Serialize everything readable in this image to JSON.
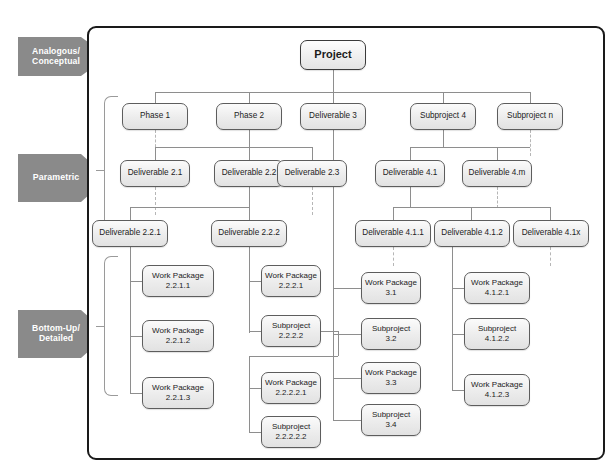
{
  "diagram": {
    "estimating_levels": [
      {
        "id": "analogous",
        "label": "Analogous/\nConceptual"
      },
      {
        "id": "parametric",
        "label": "Parametric"
      },
      {
        "id": "bottom-up",
        "label": "Bottom-Up/\nDetailed"
      }
    ],
    "colors": {
      "arrow_fill": "#8a8a8a",
      "arrow_text": "#ffffff",
      "node_border": "#5d5d5d",
      "node_fill_top": "#fbfbfb",
      "node_fill_bottom": "#e2e2e2",
      "connector": "#8e8e8e",
      "frame_border": "#1a1a1a",
      "bracket": "#9a9a9a"
    },
    "nodes": {
      "root": "Project",
      "level1": [
        "Phase 1",
        "Phase 2",
        "Deliverable 3",
        "Subproject 4",
        "Subproject n"
      ],
      "level2": [
        "Deliverable 2.1",
        "Deliverable 2.2",
        "Deliverable 2.3",
        "Deliverable 4.1",
        "Deliverable 4.m"
      ],
      "level3": [
        "Deliverable 2.2.1",
        "Deliverable 2.2.2",
        "Deliverable 4.1.1",
        "Deliverable 4.1.2",
        "Deliverable 4.1x"
      ],
      "col_2_2_1": [
        "Work Package\n2.2.1.1",
        "Work Package\n2.2.1.2",
        "Work Package\n2.2.1.3"
      ],
      "col_2_2_2": [
        "Work Package\n2.2.2.1",
        "Subproject\n2.2.2.2"
      ],
      "col_2_2_2_2": [
        "Work Package\n2.2.2.2.1",
        "Subproject\n2.2.2.2.2"
      ],
      "col_3": [
        "Work Package\n3.1",
        "Subproject\n3.2",
        "Work Package\n3.3",
        "Subproject\n3.4"
      ],
      "col_4_1_2": [
        "Work Package\n4.1.2.1",
        "Subproject\n4.1.2.2",
        "Work Package\n4.1.2.3"
      ]
    }
  }
}
